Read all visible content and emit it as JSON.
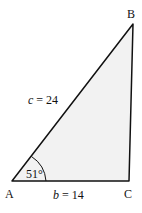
{
  "diagram": {
    "type": "triangle",
    "fill_color": "#f2f2f2",
    "stroke_color": "#111111",
    "vertices": {
      "A": {
        "label": "A"
      },
      "B": {
        "label": "B"
      },
      "C": {
        "label": "C"
      }
    },
    "sides": {
      "c": {
        "label": "c = 24",
        "var": "c",
        "value": "24"
      },
      "b": {
        "label": "b = 14",
        "var": "b",
        "value": "14"
      }
    },
    "angle_A": {
      "label": "51°"
    }
  }
}
